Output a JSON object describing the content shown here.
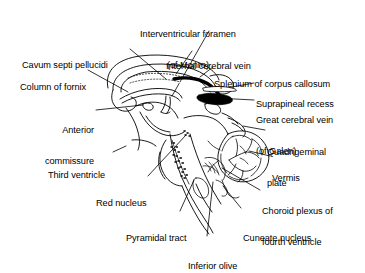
{
  "figure": {
    "type": "anatomical-line-drawing",
    "background_color": "#ffffff",
    "ink_color": "#000000",
    "width": 365,
    "height": 263
  },
  "labels": [
    {
      "id": "interventricular-foramen",
      "line1": "Interventricular foramen",
      "line2": "(of Monro)",
      "align": "center",
      "x": 188,
      "y": 8
    },
    {
      "id": "cavum-septi-pellucidi",
      "line1": "Cavum septi pellucidi",
      "line2": "",
      "align": "left",
      "x": 22,
      "y": 39
    },
    {
      "id": "internal-cerebral-vein",
      "line1": "Internal cerebral vein",
      "line2": "",
      "align": "left",
      "x": 166,
      "y": 40
    },
    {
      "id": "column-of-fornix",
      "line1": "Column of fornix",
      "line2": "",
      "align": "left",
      "x": 20,
      "y": 61
    },
    {
      "id": "splenium-of-corpus-callosum",
      "line1": "Splenium of corpus callosum",
      "line2": "",
      "align": "left",
      "x": 214,
      "y": 58
    },
    {
      "id": "suprapineal-recess",
      "line1": "Suprapineal recess",
      "line2": "",
      "align": "left",
      "x": 256,
      "y": 78
    },
    {
      "id": "great-cerebral-vein",
      "line1": "Great cerebral vein",
      "line2": "(of Galen)",
      "align": "left",
      "x": 256,
      "y": 94
    },
    {
      "id": "anterior-commissure",
      "line1": "Anterior",
      "line2": "commissure",
      "align": "right",
      "x": 38,
      "y": 104
    },
    {
      "id": "quadrigeminal-plate",
      "line1": "Quadrigeminal",
      "line2": "plate",
      "align": "left",
      "x": 267,
      "y": 126
    },
    {
      "id": "vermis",
      "line1": "Vermis",
      "line2": "",
      "align": "left",
      "x": 272,
      "y": 152
    },
    {
      "id": "third-ventricle",
      "line1": "Third ventricle",
      "line2": "",
      "align": "left",
      "x": 48,
      "y": 149
    },
    {
      "id": "red-nucleus",
      "line1": "Red nucleus",
      "line2": "",
      "align": "left",
      "x": 96,
      "y": 177
    },
    {
      "id": "choroid-plexus-fourth-ventricle",
      "line1": "Choroid plexus of",
      "line2": "fourth ventricle",
      "align": "left",
      "x": 262,
      "y": 185
    },
    {
      "id": "pyramidal-tract",
      "line1": "Pyramidal tract",
      "line2": "",
      "align": "left",
      "x": 126,
      "y": 212
    },
    {
      "id": "cuneate-nucleus",
      "line1": "Cuneate nucleus",
      "line2": "",
      "align": "left",
      "x": 243,
      "y": 212
    },
    {
      "id": "inferior-olive",
      "line1": "Inferior olive",
      "line2": "",
      "align": "left",
      "x": 188,
      "y": 240
    }
  ],
  "structures": [
    {
      "id": "corpus-callosum",
      "name": "Corpus callosum"
    },
    {
      "id": "fornix",
      "name": "Fornix"
    },
    {
      "id": "cavum-septum",
      "name": "Cavum septi pellucidi"
    },
    {
      "id": "internal-cerebral-vein-shape",
      "name": "Internal cerebral vein",
      "fill": "#000000"
    },
    {
      "id": "great-cerebral-vein-shape",
      "name": "Great cerebral vein of Galen",
      "fill": "#000000"
    },
    {
      "id": "brainstem",
      "name": "Brainstem"
    },
    {
      "id": "cerebellum",
      "name": "Cerebellum with arbor vitae"
    },
    {
      "id": "medulla",
      "name": "Medulla oblongata"
    },
    {
      "id": "pyramidal-tract-shape",
      "name": "Pyramidal tract (stippled)"
    }
  ]
}
